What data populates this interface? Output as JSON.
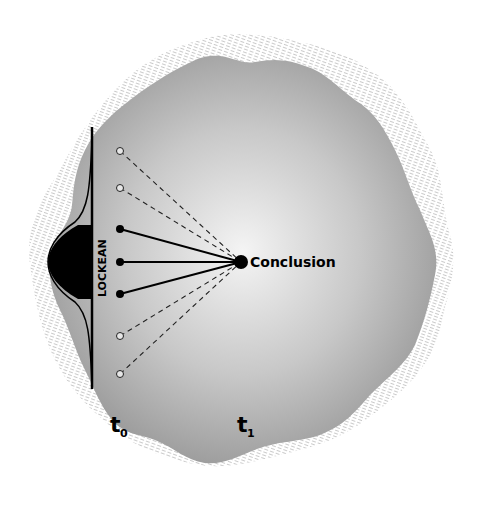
{
  "diagram": {
    "conclusion_label": "Conclusion",
    "axis_label": "LOCKEAN",
    "time_labels": {
      "t0": {
        "base": "t",
        "sub": "0"
      },
      "t1": {
        "base": "t",
        "sub": "1"
      }
    },
    "premises": [
      {
        "type": "open",
        "line": "dashed"
      },
      {
        "type": "open",
        "line": "dashed"
      },
      {
        "type": "filled",
        "line": "solid"
      },
      {
        "type": "filled",
        "line": "solid"
      },
      {
        "type": "filled",
        "line": "solid"
      },
      {
        "type": "open",
        "line": "dashed"
      },
      {
        "type": "open",
        "line": "dashed"
      }
    ],
    "colors": {
      "blob_center": "#f4f4f4",
      "blob_edge": "#9a9a9a",
      "hatch": "#c8c8c8",
      "ink": "#000000"
    }
  }
}
